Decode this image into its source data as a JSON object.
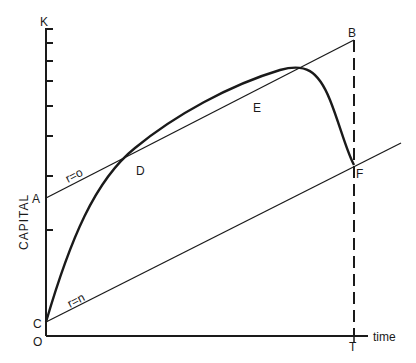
{
  "diagram": {
    "y_axis_label": "CAPITAL",
    "x_axis_label": "time",
    "points": {
      "K": "K",
      "A": "A",
      "B": "B",
      "C": "C",
      "D": "D",
      "E": "E",
      "F": "F",
      "O": "O",
      "T": "T"
    },
    "lines": {
      "upper": "r=o",
      "lower": "r=n"
    },
    "colors": {
      "ink": "#1a1a1a",
      "background": "#ffffff"
    }
  }
}
